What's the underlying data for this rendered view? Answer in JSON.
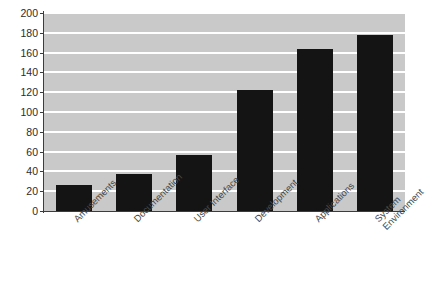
{
  "chart_data": {
    "type": "bar",
    "title": "",
    "xlabel": "",
    "ylabel": "",
    "categories": [
      "Amusements",
      "Documentation",
      "User Interface",
      "Development",
      "Applications",
      "System Environment"
    ],
    "values": [
      26,
      37,
      57,
      122,
      164,
      178
    ],
    "ylim": [
      0,
      200
    ],
    "yticks": [
      0,
      20,
      40,
      60,
      80,
      100,
      120,
      140,
      160,
      180,
      200
    ],
    "ytick_labels": [
      "0",
      "20",
      "40",
      "60",
      "80",
      "100",
      "120",
      "140",
      "160",
      "180",
      "200"
    ],
    "grid": true,
    "grid_axis": "y",
    "legend": false,
    "legend_position": "none",
    "bar_color": "#141414",
    "plot_background": "#c9c9c9",
    "gridline_color": "#ffffff",
    "axis_color": "#3c3c3c",
    "label_rotation_degrees": -45
  }
}
